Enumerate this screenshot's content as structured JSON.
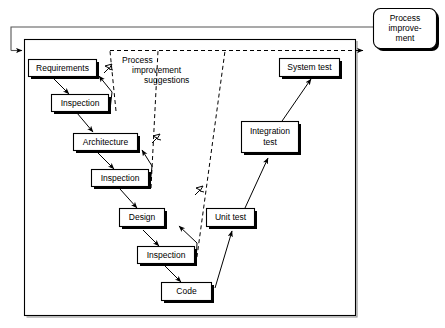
{
  "diagram": {
    "colors": {
      "stroke": "#000000",
      "box_fill": "#ffffff",
      "loop_stroke": "#555555",
      "frame_shadow": "#8a8a8a",
      "background": "#ffffff"
    },
    "outer_loop": {
      "name": "process-improvement-return-loop",
      "style": "solid"
    },
    "annotation": {
      "name": "process-improvement-suggestions-note",
      "line1": "Process",
      "line2": "improvement",
      "line3": "suggestions"
    },
    "nodes": [
      {
        "id": "process-improvement",
        "label_line1": "Process",
        "label_line2": "improve-",
        "label_line3": "ment",
        "shape": "rounded-rect"
      },
      {
        "id": "requirements",
        "label": "Requirements",
        "shape": "rect"
      },
      {
        "id": "inspection-1",
        "label": "Inspection",
        "shape": "rect"
      },
      {
        "id": "architecture",
        "label": "Architecture",
        "shape": "rect"
      },
      {
        "id": "inspection-2",
        "label": "Inspection",
        "shape": "rect"
      },
      {
        "id": "design",
        "label": "Design",
        "shape": "rect"
      },
      {
        "id": "inspection-3",
        "label": "Inspection",
        "shape": "rect"
      },
      {
        "id": "code",
        "label": "Code",
        "shape": "rect"
      },
      {
        "id": "unit-test",
        "label": "Unit test",
        "shape": "rect"
      },
      {
        "id": "integration-test",
        "label_line1": "Integration",
        "label_line2": "test",
        "shape": "rect"
      },
      {
        "id": "system-test",
        "label": "System test",
        "shape": "rect"
      }
    ],
    "edges": [
      {
        "from": "requirements",
        "to": "inspection-1",
        "style": "solid"
      },
      {
        "from": "inspection-1",
        "to": "requirements",
        "style": "solid"
      },
      {
        "from": "inspection-1",
        "to": "architecture",
        "style": "solid"
      },
      {
        "from": "architecture",
        "to": "inspection-2",
        "style": "solid"
      },
      {
        "from": "inspection-2",
        "to": "architecture",
        "style": "solid"
      },
      {
        "from": "inspection-2",
        "to": "design",
        "style": "solid"
      },
      {
        "from": "design",
        "to": "inspection-3",
        "style": "solid"
      },
      {
        "from": "inspection-3",
        "to": "design",
        "style": "solid"
      },
      {
        "from": "inspection-3",
        "to": "code",
        "style": "solid"
      },
      {
        "from": "code",
        "to": "unit-test",
        "style": "solid"
      },
      {
        "from": "unit-test",
        "to": "integration-test",
        "style": "solid"
      },
      {
        "from": "integration-test",
        "to": "system-test",
        "style": "solid"
      },
      {
        "from": "inspection-1",
        "to": "process-improvement",
        "style": "dashed"
      },
      {
        "from": "inspection-2",
        "to": "process-improvement",
        "style": "dashed"
      },
      {
        "from": "inspection-3",
        "to": "process-improvement",
        "style": "dashed"
      },
      {
        "from": "process-improvement",
        "to": "process-frame",
        "style": "solid"
      }
    ]
  }
}
